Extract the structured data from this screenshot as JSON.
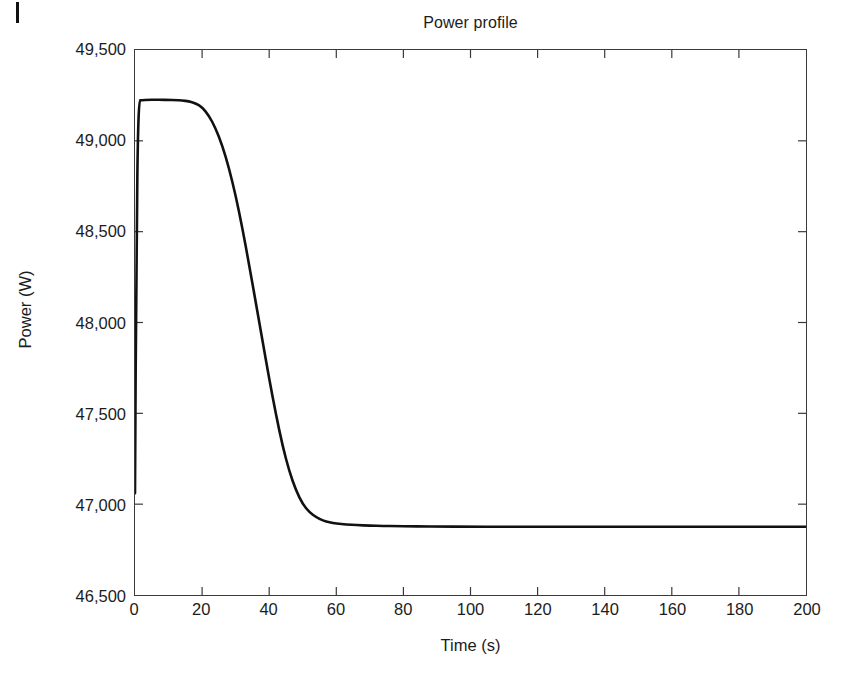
{
  "figure": {
    "artifact_name": "scan-mark",
    "background_color": "#ffffff"
  },
  "chart_data": {
    "type": "line",
    "title": "Power profile",
    "xlabel": "Time (s)",
    "ylabel": "Power (W)",
    "xlim": [
      0,
      200
    ],
    "ylim": [
      46500,
      49500
    ],
    "xticks": [
      0,
      20,
      40,
      60,
      80,
      100,
      120,
      140,
      160,
      180,
      200
    ],
    "xtick_labels": [
      "0",
      "20",
      "40",
      "60",
      "80",
      "100",
      "120",
      "140",
      "160",
      "180",
      "200"
    ],
    "yticks": [
      46500,
      47000,
      47500,
      48000,
      48500,
      49000,
      49500
    ],
    "ytick_labels": [
      "46,500",
      "47,000",
      "47,500",
      "48,000",
      "48,500",
      "49,000",
      "49,500"
    ],
    "grid": false,
    "legend": null,
    "line_color": "#111111",
    "line_width": 2.6,
    "series": [
      {
        "name": "Power",
        "x": [
          0,
          0.4,
          1,
          2,
          4,
          6,
          8,
          10,
          12,
          14,
          16,
          18,
          20,
          22,
          24,
          26,
          28,
          30,
          32,
          34,
          36,
          38,
          40,
          42,
          44,
          46,
          48,
          50,
          52,
          54,
          56,
          58,
          60,
          63,
          66,
          70,
          74,
          78,
          82,
          86,
          90,
          100,
          110,
          120,
          130,
          140,
          150,
          160,
          170,
          180,
          190,
          200
        ],
        "y": [
          47060,
          48400,
          49222,
          49224,
          49226,
          49226,
          49226,
          49225,
          49224,
          49222,
          49218,
          49208,
          49185,
          49140,
          49070,
          48975,
          48850,
          48700,
          48520,
          48320,
          48110,
          47900,
          47690,
          47495,
          47320,
          47180,
          47075,
          47000,
          46955,
          46928,
          46910,
          46900,
          46893,
          46888,
          46885,
          46882,
          46880,
          46879,
          46878,
          46877,
          46877,
          46876,
          46876,
          46876,
          46876,
          46876,
          46876,
          46876,
          46876,
          46876,
          46876,
          46876
        ]
      }
    ],
    "annotations": {
      "initial_value": 47060,
      "plateau_value": 49225,
      "final_value": 46876
    }
  }
}
